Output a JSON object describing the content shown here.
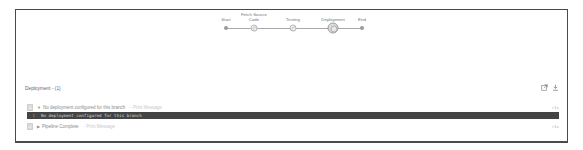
{
  "pipeline": {
    "stages": [
      {
        "label": "Start",
        "type": "dot"
      },
      {
        "label": "Fetch Source Code",
        "type": "ring"
      },
      {
        "label": "Testing",
        "type": "ring"
      },
      {
        "label": "Deployment",
        "type": "active"
      },
      {
        "label": "End",
        "type": "dot"
      }
    ]
  },
  "panel": {
    "header": "Deployment - (1)",
    "icons": [
      "external-link-icon",
      "download-icon"
    ],
    "rows": [
      {
        "title": "No deployment configured for this branch",
        "subtitle": "- Print Message",
        "toggle": "▼",
        "duration": "<1s",
        "expanded": true
      },
      {
        "title": "Pipeline Complete",
        "subtitle": "- Print Message",
        "toggle": "▶",
        "duration": "<1s",
        "expanded": false
      }
    ],
    "log_lines": [
      {
        "number": "1",
        "text": "No deployment configured for this branch"
      }
    ]
  }
}
